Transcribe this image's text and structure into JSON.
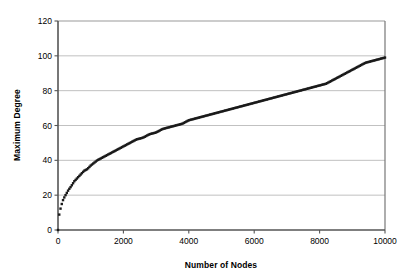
{
  "chart_data": {
    "type": "scatter",
    "title": "",
    "xlabel": "Number of Nodes",
    "ylabel": "Maximum Degree",
    "xlim": [
      0,
      10000
    ],
    "ylim": [
      0,
      120
    ],
    "xticks": [
      0,
      2000,
      4000,
      6000,
      8000,
      10000
    ],
    "yticks": [
      0,
      20,
      40,
      60,
      80,
      100,
      120
    ],
    "xtick_labels": [
      "0",
      "2000",
      "4000",
      "6000",
      "8000",
      "10000"
    ],
    "ytick_labels": [
      "0",
      "20",
      "40",
      "60",
      "80",
      "100",
      "120"
    ],
    "grid": "horizontal",
    "grid_color": "#a6a6a6",
    "axis_color": "#555555",
    "legend": "none",
    "marker_color": "#1a1a1a",
    "series": [
      {
        "name": "Maximum Degree",
        "x": [
          10,
          30,
          60,
          100,
          150,
          200,
          260,
          320,
          400,
          500,
          600,
          700,
          800,
          900,
          1000,
          1200,
          1400,
          1600,
          1800,
          2000,
          2200,
          2400,
          2600,
          2800,
          3000,
          3200,
          3400,
          3600,
          3800,
          4000,
          4200,
          4400,
          4600,
          4800,
          5000,
          5200,
          5400,
          5600,
          5800,
          6000,
          6200,
          6400,
          6600,
          6800,
          7000,
          7200,
          7400,
          7600,
          7800,
          8000,
          8200,
          8400,
          8600,
          8800,
          9000,
          9200,
          9400,
          9600,
          9800,
          10000
        ],
        "y": [
          4,
          8,
          11,
          14,
          17,
          19,
          21,
          23,
          25,
          28,
          30,
          32,
          34,
          35,
          37,
          40,
          42,
          44,
          46,
          48,
          50,
          52,
          53,
          55,
          56,
          58,
          59,
          60,
          61,
          63,
          64,
          65,
          66,
          67,
          68,
          69,
          70,
          71,
          72,
          73,
          74,
          75,
          76,
          77,
          78,
          79,
          80,
          81,
          82,
          83,
          84,
          86,
          88,
          90,
          92,
          94,
          96,
          97,
          98,
          99
        ]
      }
    ]
  },
  "axes": {
    "x_title": "Number of Nodes",
    "y_title": "Maximum Degree"
  }
}
